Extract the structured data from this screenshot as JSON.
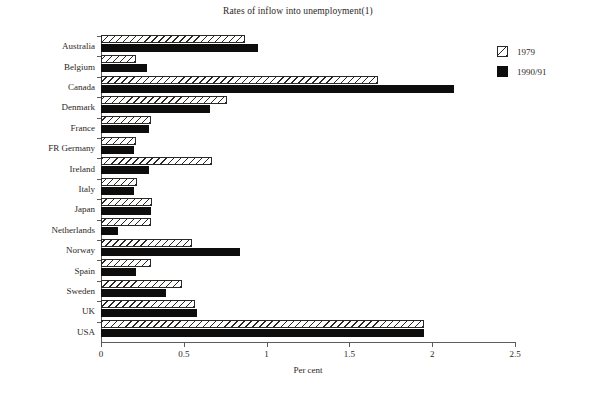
{
  "chart_data": {
    "type": "bar",
    "orientation": "horizontal",
    "title": "Rates of inflow into unemployment(1)",
    "xlabel": "Per cent",
    "ylabel": "",
    "xlim": [
      0,
      2.5
    ],
    "xticks": [
      0,
      0.5,
      1,
      1.5,
      2,
      2.5
    ],
    "xtick_labels": [
      "0",
      "0.5",
      "1",
      "1.5",
      "2",
      "2.5"
    ],
    "grid": false,
    "legend_position": "right",
    "categories": [
      "Australia",
      "Belgium",
      "Canada",
      "Denmark",
      "France",
      "FR Germany",
      "Ireland",
      "Italy",
      "Japan",
      "Netherlands",
      "Norway",
      "Spain",
      "Sweden",
      "UK",
      "USA"
    ],
    "series": [
      {
        "name": "1979",
        "style": "hatched",
        "color": "#ffffff",
        "values": [
          0.87,
          0.21,
          1.67,
          0.76,
          0.3,
          0.21,
          0.67,
          0.22,
          0.31,
          0.3,
          0.55,
          0.3,
          0.49,
          0.57,
          1.95
        ]
      },
      {
        "name": "1990/91",
        "style": "solid",
        "color": "#0d0d0d",
        "values": [
          0.95,
          0.28,
          2.13,
          0.66,
          0.29,
          0.2,
          0.29,
          0.2,
          0.3,
          0.1,
          0.84,
          0.21,
          0.39,
          0.58,
          1.95
        ]
      }
    ]
  },
  "legend": {
    "items": [
      {
        "label": "1979"
      },
      {
        "label": "1990/91"
      }
    ]
  }
}
